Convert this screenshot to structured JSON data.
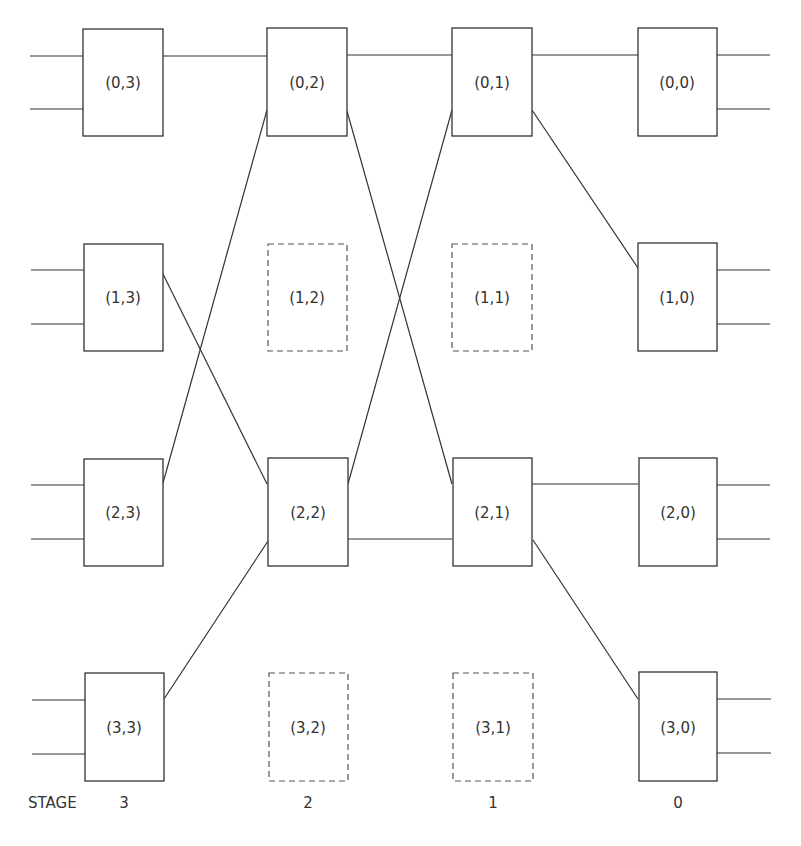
{
  "diagram": {
    "type": "multistage-interconnection-network",
    "stages_order_left_to_right": [
      3,
      2,
      1,
      0
    ],
    "stage_label_prefix": "STAGE",
    "stage_labels": {
      "s3": "3",
      "s2": "2",
      "s1": "1",
      "s0": "0"
    },
    "nodes": {
      "n03": {
        "label": "(0,3)",
        "row": 0,
        "stage": 3,
        "style": "solid"
      },
      "n02": {
        "label": "(0,2)",
        "row": 0,
        "stage": 2,
        "style": "solid"
      },
      "n01": {
        "label": "(0,1)",
        "row": 0,
        "stage": 1,
        "style": "solid"
      },
      "n00": {
        "label": "(0,0)",
        "row": 0,
        "stage": 0,
        "style": "solid"
      },
      "n13": {
        "label": "(1,3)",
        "row": 1,
        "stage": 3,
        "style": "solid"
      },
      "n12": {
        "label": "(1,2)",
        "row": 1,
        "stage": 2,
        "style": "dashed"
      },
      "n11": {
        "label": "(1,1)",
        "row": 1,
        "stage": 1,
        "style": "dashed"
      },
      "n10": {
        "label": "(1,0)",
        "row": 1,
        "stage": 0,
        "style": "solid"
      },
      "n23": {
        "label": "(2,3)",
        "row": 2,
        "stage": 3,
        "style": "solid"
      },
      "n22": {
        "label": "(2,2)",
        "row": 2,
        "stage": 2,
        "style": "solid"
      },
      "n21": {
        "label": "(2,1)",
        "row": 2,
        "stage": 1,
        "style": "solid"
      },
      "n20": {
        "label": "(2,0)",
        "row": 2,
        "stage": 0,
        "style": "solid"
      },
      "n33": {
        "label": "(3,3)",
        "row": 3,
        "stage": 3,
        "style": "solid"
      },
      "n32": {
        "label": "(3,2)",
        "row": 3,
        "stage": 2,
        "style": "dashed"
      },
      "n31": {
        "label": "(3,1)",
        "row": 3,
        "stage": 1,
        "style": "dashed"
      },
      "n30": {
        "label": "(3,0)",
        "row": 3,
        "stage": 0,
        "style": "solid"
      }
    },
    "edges": [
      {
        "from": "(0,3)",
        "to": "(0,2)"
      },
      {
        "from": "(0,2)",
        "to": "(0,1)"
      },
      {
        "from": "(0,1)",
        "to": "(0,0)"
      },
      {
        "from": "(1,3)",
        "to": "(2,2)"
      },
      {
        "from": "(2,3)",
        "to": "(0,2)"
      },
      {
        "from": "(3,3)",
        "to": "(2,2)"
      },
      {
        "from": "(0,2)",
        "to": "(2,1)"
      },
      {
        "from": "(2,2)",
        "to": "(0,1)"
      },
      {
        "from": "(2,2)",
        "to": "(2,1)"
      },
      {
        "from": "(0,1)",
        "to": "(1,0)"
      },
      {
        "from": "(2,1)",
        "to": "(2,0)"
      },
      {
        "from": "(2,1)",
        "to": "(3,0)"
      }
    ]
  }
}
